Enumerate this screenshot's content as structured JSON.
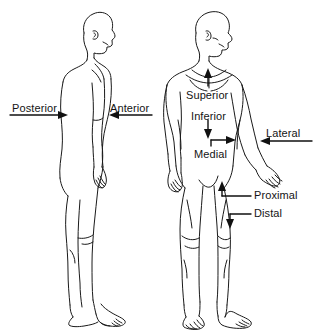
{
  "figure": {
    "background_color": "#ffffff",
    "line_color": "#1a1a1a",
    "text_color": "#141414",
    "view_left": "lateral (side / profile) view",
    "view_right": "anterior (front) view"
  },
  "labels": {
    "posterior": "Posterior",
    "anterior": "Anterior",
    "superior": "Superior",
    "inferior": "Inferior",
    "medial": "Medial",
    "lateral": "Lateral",
    "proximal": "Proximal",
    "distal": "Distal"
  },
  "annotations": [
    {
      "term": "Posterior",
      "figure": "left",
      "arrow": "right",
      "points_to": "back of torso",
      "x": 12,
      "y": 104
    },
    {
      "term": "Anterior",
      "figure": "left",
      "arrow": "left",
      "points_to": "front of torso",
      "x": 109,
      "y": 104
    },
    {
      "term": "Superior",
      "figure": "right",
      "arrow": "up",
      "points_to": "toward head",
      "x": 186,
      "y": 90
    },
    {
      "term": "Inferior",
      "figure": "right",
      "arrow": "down",
      "points_to": "toward feet",
      "x": 190,
      "y": 112
    },
    {
      "term": "Medial",
      "figure": "right",
      "arrow": "right",
      "points_to": "toward midline",
      "x": 194,
      "y": 150
    },
    {
      "term": "Lateral",
      "figure": "right",
      "arrow": "left",
      "points_to": "away from midline",
      "x": 266,
      "y": 130
    },
    {
      "term": "Proximal",
      "figure": "right",
      "arrow": "up",
      "points_to": "toward trunk (thigh)",
      "x": 253,
      "y": 192
    },
    {
      "term": "Distal",
      "figure": "right",
      "arrow": "down",
      "points_to": "away from trunk (leg)",
      "x": 253,
      "y": 210
    }
  ]
}
